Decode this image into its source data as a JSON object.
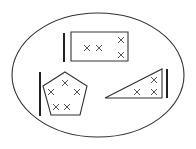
{
  "diagram": {
    "type": "set-diagram",
    "colors": {
      "stroke": "#333333",
      "background": "#ffffff"
    },
    "container": {
      "shape": "ellipse",
      "cx": 98,
      "cy": 75,
      "rx": 86,
      "ry": 62
    },
    "groups": [
      {
        "name": "rectangle",
        "shape": "rectangle",
        "x_marks": 4,
        "bar": {
          "x": 64,
          "y1": 33,
          "y2": 62
        },
        "points": [
          [
            71,
            32
          ],
          [
            128,
            32
          ],
          [
            128,
            61
          ],
          [
            71,
            61
          ]
        ],
        "marks": [
          [
            87,
            48
          ],
          [
            99,
            48
          ],
          [
            121,
            40
          ],
          [
            121,
            55
          ]
        ]
      },
      {
        "name": "pentagon",
        "shape": "pentagon",
        "x_marks": 5,
        "bar": {
          "x": 40,
          "y1": 72,
          "y2": 116
        },
        "points": [
          [
            65,
            72
          ],
          [
            87,
            86
          ],
          [
            80,
            115
          ],
          [
            51,
            115
          ],
          [
            43,
            86
          ]
        ],
        "marks": [
          [
            65,
            83
          ],
          [
            51,
            92
          ],
          [
            77,
            92
          ],
          [
            56,
            107
          ],
          [
            67,
            107
          ]
        ]
      },
      {
        "name": "triangle",
        "shape": "triangle",
        "x_marks": 3,
        "bar": {
          "x": 167,
          "y1": 69,
          "y2": 98
        },
        "points": [
          [
            105,
            98
          ],
          [
            162,
            69
          ],
          [
            162,
            98
          ]
        ],
        "marks": [
          [
            154,
            80
          ],
          [
            137,
            92
          ],
          [
            154,
            92
          ]
        ]
      }
    ]
  }
}
